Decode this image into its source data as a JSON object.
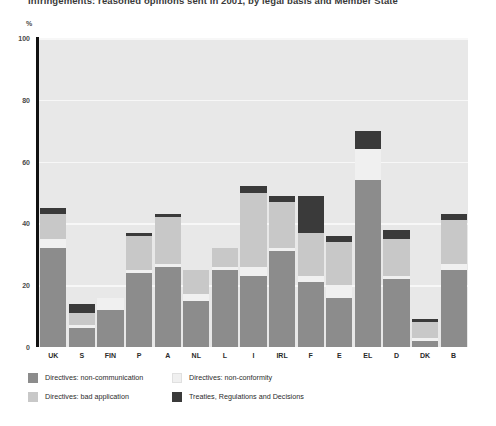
{
  "title": "Infringements: reasoned opinions sent in 2001, by legal basis and Member State",
  "axis": {
    "y_unit": "%",
    "y_ticks": [
      "100",
      "80",
      "60",
      "40",
      "20",
      "0"
    ]
  },
  "legend": {
    "items": [
      {
        "label": "Directives: non-communication",
        "color": "#8c8c8c"
      },
      {
        "label": "Directives: non-conformity",
        "color": "#f0f0f0"
      },
      {
        "label": "Directives: bad application",
        "color": "#c8c8c8"
      },
      {
        "label": "Treaties, Regulations and Decisions",
        "color": "#3a3a3a"
      }
    ]
  },
  "chart_data": {
    "type": "bar",
    "stacked": true,
    "title": "Infringements: reasoned opinions sent in 2001, by legal basis and Member State",
    "xlabel": "",
    "ylabel": "%",
    "ylim": [
      0,
      100
    ],
    "yticks": [
      0,
      20,
      40,
      60,
      80,
      100
    ],
    "grid": true,
    "legend_position": "bottom-left",
    "categories": [
      "UK",
      "S",
      "FIN",
      "P",
      "A",
      "NL",
      "L",
      "I",
      "IRL",
      "F",
      "E",
      "EL",
      "D",
      "DK",
      "B"
    ],
    "series": [
      {
        "name": "Directives: non-communication",
        "color": "#8c8c8c",
        "values": [
          32,
          6,
          12,
          24,
          26,
          15,
          25,
          23,
          31,
          21,
          16,
          54,
          22,
          2,
          25
        ]
      },
      {
        "name": "Directives: non-conformity",
        "color": "#f0f0f0",
        "values": [
          3,
          1,
          4,
          1,
          1,
          2,
          1,
          3,
          1,
          2,
          4,
          10,
          1,
          1,
          2
        ]
      },
      {
        "name": "Directives: bad application",
        "color": "#c8c8c8",
        "values": [
          8,
          4,
          0,
          11,
          15,
          8,
          6,
          24,
          15,
          14,
          14,
          0,
          12,
          5,
          14
        ]
      },
      {
        "name": "Treaties, Regulations and Decisions",
        "color": "#3a3a3a",
        "values": [
          2,
          3,
          0,
          1,
          1,
          0,
          0,
          2,
          2,
          12,
          2,
          6,
          3,
          1,
          2
        ]
      }
    ],
    "totals": [
      45,
      14,
      16,
      37,
      43,
      25,
      32,
      52,
      49,
      49,
      36,
      70,
      38,
      9,
      43
    ]
  }
}
